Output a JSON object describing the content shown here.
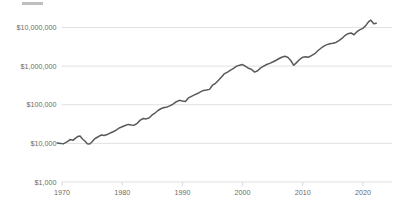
{
  "chart_data": {
    "type": "line",
    "title": "",
    "xlabel": "",
    "ylabel": "",
    "yscale": "log",
    "ylim": [
      1000,
      10000000
    ],
    "xlim": [
      1969,
      2023
    ],
    "grid": true,
    "legend": "none",
    "line_color": "#595959",
    "grid_color": "#d9d9d9",
    "tick_label_color": "#6b6b6b",
    "ytick_labels": [
      "$10,000,000",
      "$1,000,000",
      "$100,000",
      "$10,000",
      "$1,000"
    ],
    "ytick_values": [
      10000000,
      1000000,
      100000,
      10000,
      1000
    ],
    "xtick_labels": [
      "1970",
      "1980",
      "1990",
      "2000",
      "2010",
      "2020"
    ],
    "xtick_values": [
      1970,
      1980,
      1990,
      2000,
      2010,
      2020
    ],
    "series": [
      {
        "name": "value",
        "x": [
          1969.2,
          1969.8,
          1970.2,
          1970.6,
          1971.0,
          1971.4,
          1971.8,
          1972.2,
          1972.6,
          1973.0,
          1973.4,
          1973.8,
          1974.2,
          1974.6,
          1975.0,
          1975.4,
          1975.8,
          1976.2,
          1976.6,
          1977.0,
          1977.5,
          1978.0,
          1978.5,
          1979.0,
          1979.5,
          1980.0,
          1980.5,
          1981.0,
          1981.5,
          1982.0,
          1982.5,
          1983.0,
          1983.5,
          1984.0,
          1984.5,
          1985.0,
          1985.5,
          1986.0,
          1986.5,
          1987.0,
          1987.5,
          1988.0,
          1988.5,
          1989.0,
          1989.5,
          1990.0,
          1990.5,
          1991.0,
          1991.5,
          1992.0,
          1992.5,
          1993.0,
          1993.5,
          1994.0,
          1994.5,
          1995.0,
          1995.5,
          1996.0,
          1996.5,
          1997.0,
          1997.5,
          1998.0,
          1998.5,
          1999.0,
          1999.5,
          2000.0,
          2000.5,
          2001.0,
          2001.5,
          2002.0,
          2002.5,
          2003.0,
          2003.5,
          2004.0,
          2004.5,
          2005.0,
          2005.5,
          2006.0,
          2006.5,
          2007.0,
          2007.5,
          2008.0,
          2008.5,
          2009.0,
          2009.5,
          2010.0,
          2010.5,
          2011.0,
          2011.5,
          2012.0,
          2012.5,
          2013.0,
          2013.5,
          2014.0,
          2014.5,
          2015.0,
          2015.5,
          2016.0,
          2016.5,
          2017.0,
          2017.5,
          2018.0,
          2018.5,
          2019.0,
          2019.5,
          2020.0,
          2020.5,
          2021.0,
          2021.3,
          2021.8,
          2022.2
        ],
        "y": [
          10200,
          10000,
          9700,
          10500,
          11500,
          12600,
          12000,
          13500,
          15000,
          15500,
          13000,
          11500,
          9800,
          9600,
          11000,
          13000,
          14200,
          15500,
          16500,
          16000,
          17000,
          18500,
          20000,
          22000,
          25000,
          27000,
          29000,
          31000,
          30000,
          29500,
          33000,
          40000,
          44000,
          43000,
          46000,
          55000,
          62000,
          72000,
          80000,
          85000,
          88000,
          95000,
          105000,
          120000,
          130000,
          125000,
          122000,
          150000,
          165000,
          180000,
          195000,
          215000,
          235000,
          240000,
          250000,
          320000,
          360000,
          430000,
          520000,
          640000,
          700000,
          790000,
          880000,
          1000000,
          1050000,
          1100000,
          980000,
          880000,
          820000,
          700000,
          760000,
          900000,
          1000000,
          1100000,
          1180000,
          1280000,
          1400000,
          1550000,
          1700000,
          1800000,
          1700000,
          1400000,
          1050000,
          1250000,
          1500000,
          1700000,
          1750000,
          1700000,
          1900000,
          2100000,
          2500000,
          2900000,
          3300000,
          3600000,
          3800000,
          3900000,
          4100000,
          4600000,
          5200000,
          6200000,
          6900000,
          7200000,
          6500000,
          7800000,
          8800000,
          9500000,
          11500000,
          14500000,
          15500000,
          12500000,
          12800000
        ]
      }
    ]
  },
  "ui": {
    "title_placeholder": ""
  }
}
